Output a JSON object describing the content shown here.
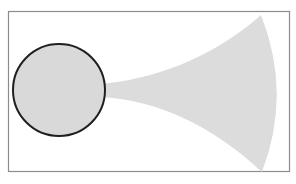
{
  "diagram": {
    "type": "shape-illustration",
    "frame": {
      "x": 8,
      "y": 11,
      "width": 281,
      "height": 160,
      "stroke": "#8c8c8c",
      "fill": "#ffffff"
    },
    "circle": {
      "cx": 59,
      "cy": 90,
      "r": 46,
      "fill": "#d9d9d9",
      "stroke": "#1f1f1f",
      "stroke_width": 2
    },
    "cone": {
      "fill": "#dcdcdc",
      "neck_x": 104,
      "neck_top_y": 84,
      "neck_bottom_y": 97,
      "tip_top": [
        261,
        15
      ],
      "tip_bottom": [
        262,
        172
      ],
      "arc_bulge_x": 284
    }
  }
}
